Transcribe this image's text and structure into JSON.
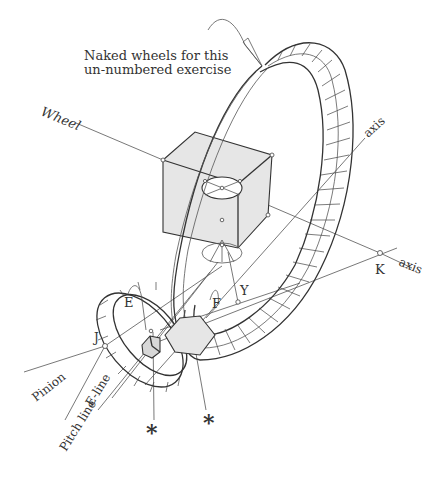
{
  "figure": {
    "type": "gear geometry diagram",
    "callout": {
      "line1": "Naked wheels for this",
      "line2": "un-numbered exercise"
    },
    "labels": {
      "wheel": "Wheel",
      "axis_upper": "axis",
      "axis_lower": "axis",
      "point_k": "K",
      "point_y": "Y",
      "point_e": "E",
      "point_f": "F",
      "point_j": "J",
      "pinion": "Pinion",
      "e_line": "E-line",
      "pitch_line": "Pitch line",
      "asterisk_left": "*",
      "asterisk_right": "*"
    },
    "colors": {
      "line": "#333333",
      "shade": "#e6e6e6",
      "background": "#ffffff"
    }
  }
}
